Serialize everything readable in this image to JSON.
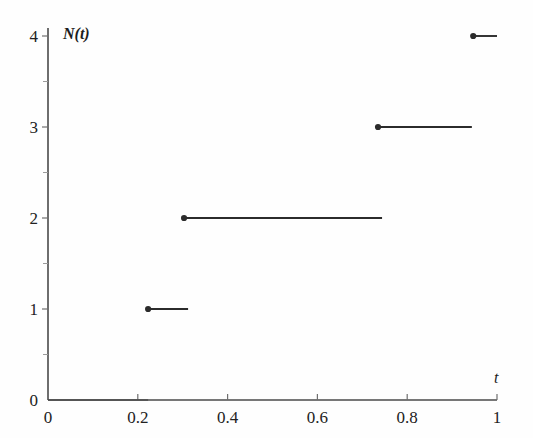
{
  "chart_data": {
    "type": "line",
    "title": "",
    "subtitle": "",
    "xlabel": "t",
    "ylabel": "N(t)",
    "xlim": [
      0,
      1
    ],
    "ylim": [
      0,
      4
    ],
    "grid": false,
    "legend": null,
    "x_ticks": [
      {
        "value": 0,
        "label": "0"
      },
      {
        "value": 0.2,
        "label": "0.2"
      },
      {
        "value": 0.4,
        "label": "0.4"
      },
      {
        "value": 0.6,
        "label": "0.6"
      },
      {
        "value": 0.8,
        "label": "0.8"
      },
      {
        "value": 1,
        "label": "1"
      }
    ],
    "y_ticks": [
      {
        "value": 0,
        "label": "0"
      },
      {
        "value": 1,
        "label": "1"
      },
      {
        "value": 2,
        "label": "2"
      },
      {
        "value": 3,
        "label": "3"
      },
      {
        "value": 4,
        "label": "4"
      }
    ],
    "x_minor_ticks": [
      0.1,
      0.3,
      0.5,
      0.7,
      0.9
    ],
    "y_minor_ticks": [
      0.5,
      1.5,
      2.5,
      3.5
    ],
    "series": [
      {
        "name": "N(t)",
        "style": "step-right-continuous",
        "color": "#2b2b2b",
        "marker": "filled-circle-left-endpoint",
        "segments": [
          {
            "y": 0,
            "x_start": 0.0,
            "x_end": 0.223,
            "marker": false
          },
          {
            "y": 1,
            "x_start": 0.223,
            "x_end": 0.312,
            "marker": true
          },
          {
            "y": 2,
            "x_start": 0.303,
            "x_end": 0.744,
            "marker": true
          },
          {
            "y": 3,
            "x_start": 0.735,
            "x_end": 0.944,
            "marker": true
          },
          {
            "y": 4,
            "x_start": 0.947,
            "x_end": 1.0,
            "marker": true
          }
        ]
      }
    ],
    "jump_times": [
      0.223,
      0.303,
      0.735,
      0.947
    ],
    "counts_after_jump": [
      1,
      2,
      3,
      4
    ]
  },
  "figure": {
    "background_color": "#fefefe",
    "axis_color": "#4a4a4a",
    "data_color": "#2b2b2b",
    "text_color": "#222222"
  }
}
